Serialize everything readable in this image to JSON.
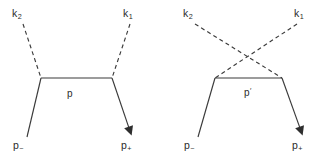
{
  "figure": {
    "width": 327,
    "height": 157,
    "background_color": "#ffffff",
    "line_color": "#3a3a3a",
    "text_color": "#2b2b2b"
  },
  "diagrams": [
    {
      "id": "uncrossed",
      "name": "uncrossed-diagram",
      "labels": {
        "incoming_photon_left": "k",
        "incoming_photon_left_sub": "2",
        "incoming_photon_right": "k",
        "incoming_photon_right_sub": "1",
        "propagator": "p",
        "propagator_prime": "",
        "incoming_fermion": "p",
        "incoming_fermion_sub": "−",
        "outgoing_fermion": "p",
        "outgoing_fermion_sub": "+"
      },
      "geometry": {
        "vertex_left": [
          41,
          78
        ],
        "vertex_right": [
          112,
          78
        ],
        "photon_left_start": [
          23,
          24
        ],
        "photon_right_start": [
          130,
          24
        ],
        "fermion_in_start": [
          27,
          137
        ],
        "fermion_out_end": [
          131,
          133
        ]
      }
    },
    {
      "id": "crossed",
      "name": "crossed-diagram",
      "labels": {
        "incoming_photon_left": "k",
        "incoming_photon_left_sub": "2",
        "incoming_photon_right": "k",
        "incoming_photon_right_sub": "1",
        "propagator": "p",
        "propagator_prime": "′",
        "incoming_fermion": "p",
        "incoming_fermion_sub": "−",
        "outgoing_fermion": "p",
        "outgoing_fermion_sub": "+"
      },
      "geometry": {
        "vertex_left": [
          215,
          78
        ],
        "vertex_right": [
          282,
          78
        ],
        "photon_left_start": [
          195,
          24
        ],
        "photon_right_start": [
          297,
          24
        ],
        "crossing_point": [
          247,
          58
        ],
        "fermion_in_start": [
          198,
          137
        ],
        "fermion_out_end": [
          302,
          133
        ]
      }
    }
  ],
  "label_positions": {
    "d1_k2": [
      12,
      8
    ],
    "d1_k1": [
      123,
      8
    ],
    "d1_p": [
      67,
      89
    ],
    "d1_pminus": [
      13,
      140
    ],
    "d1_pplus": [
      121,
      140
    ],
    "d2_k2": [
      183,
      8
    ],
    "d2_k1": [
      294,
      8
    ],
    "d2_pprime": [
      244,
      88
    ],
    "d2_pminus": [
      184,
      140
    ],
    "d2_pplus": [
      292,
      140
    ]
  }
}
